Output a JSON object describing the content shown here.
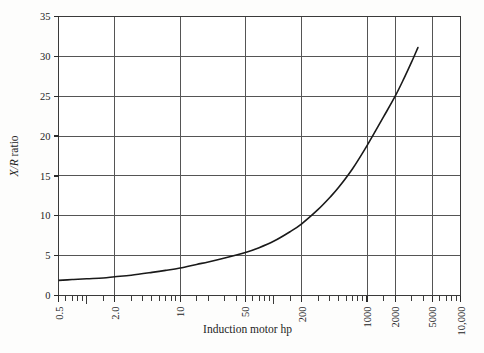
{
  "figure": {
    "name": "x-r-ratio-vs-induction-motor-hp",
    "background_color": "#fdfdfc",
    "frame_color": "#3a3a3a",
    "grid_color": "#555555",
    "curve_color": "#1a1a1a"
  },
  "chart_data": {
    "type": "line",
    "title": "",
    "subtitle": "",
    "xlabel": "Induction motor hp",
    "ylabel": "X/R ratio",
    "ylabel_parts": {
      "italic": "X/R",
      "roman": " ratio"
    },
    "xscale": "log",
    "yscale": "linear",
    "xlim": [
      0.5,
      10000
    ],
    "ylim": [
      0,
      35
    ],
    "grid": true,
    "grid_axes": "both",
    "legend": null,
    "legend_position": "none",
    "x_major_ticks": [
      0.5,
      2.0,
      10,
      50,
      200,
      1000,
      2000,
      5000,
      10000
    ],
    "x_tick_labels": [
      "0.5",
      "2.0",
      "10",
      "50",
      "200",
      "1000",
      "2000",
      "5000",
      "10,000"
    ],
    "x_gridline_values": [
      2.0,
      10,
      50,
      200,
      1000,
      2000,
      5000
    ],
    "x_minor_ticks": [
      0.6,
      0.7,
      0.8,
      0.9,
      1.0,
      1.5,
      3,
      4,
      5,
      6,
      7,
      8,
      9,
      15,
      20,
      30,
      40,
      60,
      70,
      80,
      90,
      100,
      150,
      300,
      400,
      500,
      600,
      700,
      800,
      900,
      1500,
      3000,
      4000,
      6000,
      7000,
      8000,
      9000
    ],
    "y_major_ticks": [
      0,
      5,
      10,
      15,
      20,
      25,
      30,
      35
    ],
    "y_tick_labels": [
      "0",
      "5",
      "10",
      "15",
      "20",
      "25",
      "30",
      "35"
    ],
    "series": [
      {
        "name": "X/R ratio",
        "color": "#1a1a1a",
        "line_width": 1.6,
        "x": [
          0.5,
          0.7,
          1.0,
          1.5,
          2.0,
          3.0,
          5.0,
          7.0,
          10,
          15,
          20,
          30,
          50,
          70,
          100,
          150,
          200,
          300,
          400,
          500,
          700,
          1000,
          1500,
          2000,
          2500,
          3000,
          3500
        ],
        "y": [
          1.9,
          2.0,
          2.1,
          2.2,
          2.35,
          2.55,
          2.9,
          3.15,
          3.45,
          3.9,
          4.2,
          4.7,
          5.4,
          6.0,
          6.8,
          8.0,
          9.0,
          10.8,
          12.3,
          13.6,
          15.9,
          18.8,
          22.4,
          25.0,
          27.3,
          29.3,
          31.1
        ]
      }
    ],
    "annotations": [],
    "notable_points": [
      {
        "x": 1000,
        "y": 25,
        "note": "curve crosses 25 at 1000 hp"
      },
      {
        "x": 200,
        "y": 9,
        "note": "curve crosses 200 hp gridline near 9"
      },
      {
        "x": 50,
        "y": 5.4,
        "note": "curve near 5 at 50 hp"
      },
      {
        "x": 0.5,
        "y": 1.9,
        "note": "curve start at left frame"
      }
    ]
  }
}
